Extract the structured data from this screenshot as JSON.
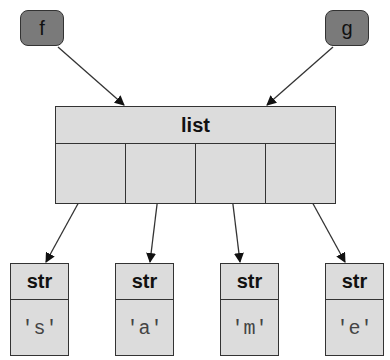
{
  "variables": [
    {
      "name": "f",
      "color": "#7a7a7a"
    },
    {
      "name": "g",
      "color": "#7a7a7a"
    }
  ],
  "list": {
    "type_label": "list",
    "cell_count": 4
  },
  "strings": [
    {
      "type_label": "str",
      "value": "'s'"
    },
    {
      "type_label": "str",
      "value": "'a'"
    },
    {
      "type_label": "str",
      "value": "'m'"
    },
    {
      "type_label": "str",
      "value": "'e'"
    }
  ],
  "colors": {
    "box_fill": "#dcdcdc",
    "variable_fill": "#7a7a7a",
    "stroke": "#333333"
  }
}
